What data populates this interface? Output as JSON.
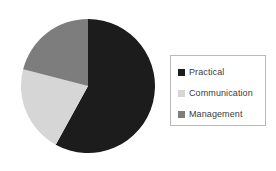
{
  "chart_data": {
    "type": "pie",
    "title": "",
    "subtitle": "",
    "xlabel": "",
    "ylabel": "",
    "grid": false,
    "legend_position": "right",
    "start_angle_deg": 0,
    "direction": "clockwise",
    "categories": [
      "Practical",
      "Communication",
      "Management"
    ],
    "values": [
      58,
      21,
      21
    ],
    "value_unit": "percent",
    "slices": [
      {
        "label": "Practical",
        "value": 58,
        "color": "#1c1c1c",
        "start_angle_deg": 0,
        "end_angle_deg": 208.8
      },
      {
        "label": "Communication",
        "value": 21,
        "color": "#d6d6d6",
        "start_angle_deg": 208.8,
        "end_angle_deg": 284.4
      },
      {
        "label": "Management",
        "value": 21,
        "color": "#7d7d7d",
        "start_angle_deg": 284.4,
        "end_angle_deg": 360
      }
    ],
    "annotations": []
  },
  "legend": {
    "entries": [
      {
        "label": "Practical",
        "color": "#1c1c1c",
        "swatch_icon": "square-swatch-icon"
      },
      {
        "label": "Communication",
        "color": "#d6d6d6",
        "swatch_icon": "square-swatch-icon"
      },
      {
        "label": "Management",
        "color": "#7d7d7d",
        "swatch_icon": "square-swatch-icon"
      }
    ],
    "border_color": "#b9b9b9",
    "background": "#ffffff"
  },
  "canvas": {
    "background": "#ffffff",
    "pie_center_x": 67,
    "pie_center_y": 73,
    "pie_radius": 67
  }
}
